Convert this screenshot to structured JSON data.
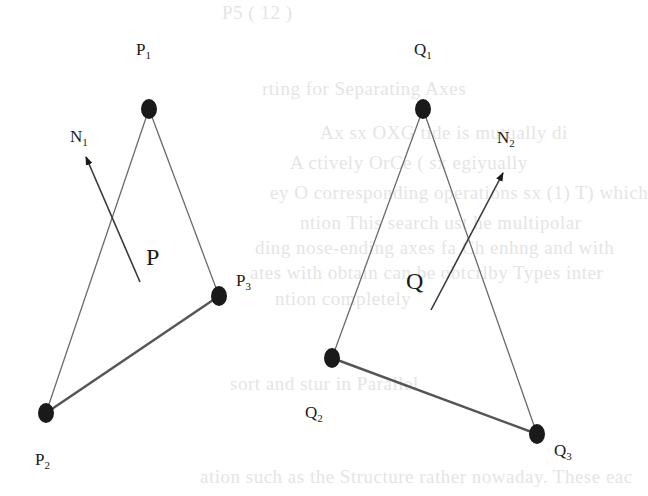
{
  "colors": {
    "ink": "#1a1a1a",
    "line": "#6b6b6b",
    "edge_thick": "#555555",
    "background": "#ffffff"
  },
  "left_triangle": {
    "vertices": [
      {
        "id": "P1",
        "label": "P",
        "sub": "1",
        "x": 149,
        "y": 109,
        "lx": 136,
        "ly": 55
      },
      {
        "id": "P2",
        "label": "P",
        "sub": "2",
        "x": 46,
        "y": 413,
        "lx": 35,
        "ly": 465
      },
      {
        "id": "P3",
        "label": "P",
        "sub": "3",
        "x": 219,
        "y": 296,
        "lx": 236,
        "ly": 286
      }
    ],
    "edges": [
      {
        "from": "P1",
        "to": "P2",
        "width": 1.3
      },
      {
        "from": "P1",
        "to": "P3",
        "width": 1.3
      },
      {
        "from": "P2",
        "to": "P3",
        "width": 2.4
      }
    ],
    "point": {
      "label": "P",
      "x": 140,
      "y": 282,
      "lx": 146,
      "ly": 265
    },
    "normal": {
      "label": "N",
      "sub": "1",
      "x1": 140,
      "y1": 282,
      "x2": 86,
      "y2": 157,
      "lx": 70,
      "ly": 142
    }
  },
  "right_triangle": {
    "vertices": [
      {
        "id": "Q1",
        "label": "Q",
        "sub": "1",
        "x": 423,
        "y": 109,
        "lx": 414,
        "ly": 55
      },
      {
        "id": "Q2",
        "label": "Q",
        "sub": "2",
        "x": 332,
        "y": 358,
        "lx": 305,
        "ly": 418
      },
      {
        "id": "Q3",
        "label": "Q",
        "sub": "3",
        "x": 537,
        "y": 434,
        "lx": 554,
        "ly": 456
      }
    ],
    "edges": [
      {
        "from": "Q1",
        "to": "Q2",
        "width": 1.3
      },
      {
        "from": "Q1",
        "to": "Q3",
        "width": 1.3
      },
      {
        "from": "Q2",
        "to": "Q3",
        "width": 2.4
      }
    ],
    "point": {
      "label": "Q",
      "x": 431,
      "y": 310,
      "lx": 406,
      "ly": 289
    },
    "normal": {
      "label": "N",
      "sub": "2",
      "x1": 431,
      "y1": 310,
      "x2": 503,
      "y2": 173,
      "lx": 497,
      "ly": 143
    }
  },
  "ghost_text": [
    {
      "text": "P5 ( 12 )",
      "x": 222,
      "y": 2
    },
    {
      "text": "rting for Separating Axes",
      "x": 262,
      "y": 78
    },
    {
      "text": "Ax    sx  OXG   tide  is mutually di",
      "x": 320,
      "y": 122
    },
    {
      "text": "   A  ctively  OrCe   (   sx  egiyually",
      "x": 290,
      "y": 152
    },
    {
      "text": "ey  O  corresponding  operations  sx (1) T) which",
      "x": 270,
      "y": 182
    },
    {
      "text": "     ntion  This search  ust   he  multipolar",
      "x": 300,
      "y": 212
    },
    {
      "text": "ding  nose-ending  axes  fa   Ch   enhng  and  with",
      "x": 255,
      "y": 237
    },
    {
      "text": "ates  with  obtain  can be  obtcrlby  Types  inter",
      "x": 250,
      "y": 262
    },
    {
      "text": "     ntion  completely",
      "x": 275,
      "y": 288
    },
    {
      "text": "sort  and stur  in  Parallel",
      "x": 230,
      "y": 373
    },
    {
      "text": "ation  such  as  the  Structure  rather  nowaday.  These  eac",
      "x": 200,
      "y": 466
    }
  ]
}
